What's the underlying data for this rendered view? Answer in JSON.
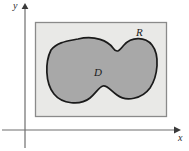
{
  "figure": {
    "background_color": "#ffffff"
  },
  "axes": {
    "x_axis": {
      "label": "x",
      "name": "x-axis",
      "color": "#6e6e6e",
      "y_position": 130,
      "x_start": 2,
      "x_end": 176,
      "arrow": "right"
    },
    "y_axis": {
      "label": "y",
      "name": "y-axis",
      "color": "#6e6e6e",
      "x_position": 25,
      "y_start": 148,
      "y_end": 6,
      "arrow": "up"
    },
    "origin": {
      "x": 25,
      "y": 130
    }
  },
  "shapes": {
    "rectangle": {
      "label": "R",
      "name": "rectangle-region-R",
      "fill_color": "#e9e9e7",
      "stroke_color": "#8a8a8a",
      "stroke_width": 1.2,
      "x": 35,
      "y": 22,
      "width": 132,
      "height": 95
    },
    "blob": {
      "label": "D",
      "name": "blob-region-D",
      "fill_color": "#a8a8a8",
      "stroke_color": "#1a1a1a",
      "stroke_width": 1.6,
      "description": "peanut / dumbbell shaped closed curve with two lobes",
      "bounds": {
        "x_min": 48,
        "x_max": 156,
        "y_min": 38,
        "y_max": 101
      }
    }
  },
  "labels": {
    "region_outer": "R",
    "region_inner": "D",
    "axis_x": "x",
    "axis_y": "y"
  }
}
